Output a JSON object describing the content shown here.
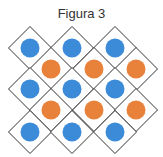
{
  "title": "Figura 3",
  "colors": {
    "blue": "#3b8bd8",
    "orange": "#e8813a",
    "stroke": "#333333"
  },
  "diamonds": [
    {
      "cx": 30,
      "cy": 48,
      "fill": "blue"
    },
    {
      "cx": 72,
      "cy": 48,
      "fill": "blue"
    },
    {
      "cx": 115,
      "cy": 48,
      "fill": "blue"
    },
    {
      "cx": 51,
      "cy": 69,
      "fill": "orange"
    },
    {
      "cx": 94,
      "cy": 69,
      "fill": "orange"
    },
    {
      "cx": 136,
      "cy": 69,
      "fill": "orange"
    },
    {
      "cx": 30,
      "cy": 89,
      "fill": "blue"
    },
    {
      "cx": 72,
      "cy": 89,
      "fill": "blue"
    },
    {
      "cx": 115,
      "cy": 89,
      "fill": "blue"
    },
    {
      "cx": 51,
      "cy": 110,
      "fill": "orange"
    },
    {
      "cx": 94,
      "cy": 110,
      "fill": "orange"
    },
    {
      "cx": 136,
      "cy": 110,
      "fill": "orange"
    },
    {
      "cx": 30,
      "cy": 132,
      "fill": "blue"
    },
    {
      "cx": 72,
      "cy": 132,
      "fill": "blue"
    },
    {
      "cx": 115,
      "cy": 132,
      "fill": "blue"
    }
  ]
}
